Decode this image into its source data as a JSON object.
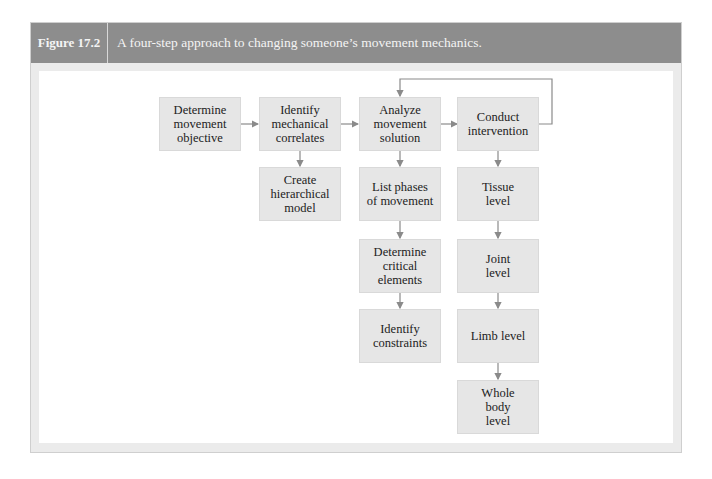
{
  "figure": {
    "label": "Figure 17.2",
    "caption": "A four-step approach to changing someone’s movement mechanics."
  },
  "steps": [
    {
      "id": "step1",
      "label": "Determine movement objective",
      "lines": [
        "Determine",
        "movement",
        "objective"
      ]
    },
    {
      "id": "step2",
      "label": "Identify mechanical correlates",
      "lines": [
        "Identify",
        "mechanical",
        "correlates"
      ]
    },
    {
      "id": "step3",
      "label": "Analyze movement solution",
      "lines": [
        "Analyze",
        "movement",
        "solution"
      ]
    },
    {
      "id": "step4",
      "label": "Conduct intervention",
      "lines": [
        "Conduct",
        "intervention"
      ]
    }
  ],
  "sub_steps": {
    "step2": [
      {
        "label": "Create hierarchical model",
        "lines": [
          "Create",
          "hierarchical",
          "model"
        ]
      }
    ],
    "step3": [
      {
        "label": "List phases of movement",
        "lines": [
          "List phases",
          "of movement"
        ]
      },
      {
        "label": "Determine critical elements",
        "lines": [
          "Determine",
          "critical",
          "elements"
        ]
      },
      {
        "label": "Identify constraints",
        "lines": [
          "Identify",
          "constraints"
        ]
      }
    ],
    "step4": [
      {
        "label": "Tissue level",
        "lines": [
          "Tissue",
          "level"
        ]
      },
      {
        "label": "Joint level",
        "lines": [
          "Joint",
          "level"
        ]
      },
      {
        "label": "Limb level",
        "lines": [
          "Limb level"
        ]
      },
      {
        "label": "Whole body level",
        "lines": [
          "Whole",
          "body",
          "level"
        ]
      }
    ]
  },
  "colors": {
    "header_bg": "#8d8d8d",
    "node_bg": "#e6e6e6",
    "arrow": "#8a8a8a",
    "frame_bg": "#ebebeb"
  }
}
